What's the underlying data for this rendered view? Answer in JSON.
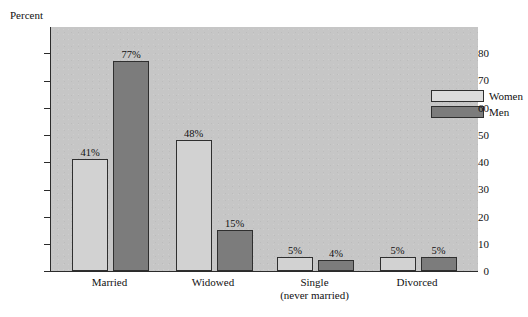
{
  "chart_data": {
    "type": "bar",
    "title": "",
    "subtitle": "",
    "xlabel": "",
    "ylabel": "Percent",
    "ylim": [
      0,
      90
    ],
    "yticks": [
      0,
      10,
      20,
      30,
      40,
      50,
      60,
      70,
      80
    ],
    "ytick_labels": [
      "0",
      "10",
      "20",
      "30",
      "40",
      "50",
      "60",
      "70",
      "80"
    ],
    "grid": false,
    "legend_position": "top-right-inside",
    "categories": [
      "Married",
      "Widowed",
      "Single\n(never married)",
      "Divorced"
    ],
    "category_lines": [
      {
        "line1": "Married",
        "line2": ""
      },
      {
        "line1": "Widowed",
        "line2": ""
      },
      {
        "line1": "Single",
        "line2": "(never married)"
      },
      {
        "line1": "Divorced",
        "line2": ""
      }
    ],
    "series": [
      {
        "name": "Women",
        "color": "#d2d2d2",
        "values": [
          41,
          48,
          5,
          5
        ],
        "labels": [
          "41%",
          "48%",
          "5%",
          "5%"
        ]
      },
      {
        "name": "Men",
        "color": "#7c7c7c",
        "values": [
          77,
          15,
          4,
          5
        ],
        "labels": [
          "77%",
          "15%",
          "4%",
          "5%"
        ]
      }
    ]
  },
  "axis": {
    "y_title": "Percent"
  },
  "legend": {
    "entries": [
      {
        "label": "Women",
        "swatch": "women-swatch"
      },
      {
        "label": "Men",
        "swatch": "men-swatch"
      }
    ]
  },
  "colors": {
    "plot_background": "#c6c6c6",
    "page_background": "#ffffff",
    "axis": "#2b2b2b",
    "women_bar": "#d2d2d2",
    "men_bar": "#7c7c7c"
  }
}
